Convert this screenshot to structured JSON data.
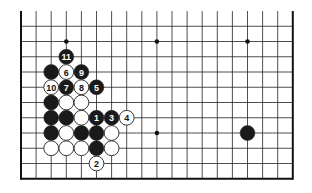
{
  "diagram": {
    "type": "go-board-partial",
    "board_size": 19,
    "visible_rows": 12,
    "grid": {
      "left": 21,
      "top": 11,
      "col_spacing": 15.1,
      "row_spacing": 15.25,
      "cols": 19,
      "rows": 12,
      "open_top": true,
      "line_color": "#222222",
      "border_color": "#111111"
    },
    "star_points": [
      {
        "col": 3,
        "row": 2
      },
      {
        "col": 9,
        "row": 2
      },
      {
        "col": 15,
        "row": 2
      },
      {
        "col": 3,
        "row": 8
      },
      {
        "col": 9,
        "row": 8
      },
      {
        "col": 15,
        "row": 8
      }
    ],
    "stones": [
      {
        "col": 3,
        "row": 3,
        "color": "black",
        "label": "11"
      },
      {
        "col": 2,
        "row": 4,
        "color": "black",
        "label": ""
      },
      {
        "col": 3,
        "row": 4,
        "color": "white",
        "label": "6"
      },
      {
        "col": 4,
        "row": 4,
        "color": "black",
        "label": "9"
      },
      {
        "col": 2,
        "row": 5,
        "color": "white",
        "label": "10"
      },
      {
        "col": 3,
        "row": 5,
        "color": "black",
        "label": "7"
      },
      {
        "col": 4,
        "row": 5,
        "color": "white",
        "label": "8"
      },
      {
        "col": 5,
        "row": 5,
        "color": "black",
        "label": "5"
      },
      {
        "col": 2,
        "row": 6,
        "color": "black",
        "label": ""
      },
      {
        "col": 3,
        "row": 6,
        "color": "white",
        "label": ""
      },
      {
        "col": 4,
        "row": 6,
        "color": "white",
        "label": ""
      },
      {
        "col": 2,
        "row": 7,
        "color": "black",
        "label": ""
      },
      {
        "col": 3,
        "row": 7,
        "color": "black",
        "label": ""
      },
      {
        "col": 4,
        "row": 7,
        "color": "white",
        "label": ""
      },
      {
        "col": 5,
        "row": 7,
        "color": "black",
        "label": "1"
      },
      {
        "col": 6,
        "row": 7,
        "color": "black",
        "label": "3"
      },
      {
        "col": 7,
        "row": 7,
        "color": "white",
        "label": "4"
      },
      {
        "col": 2,
        "row": 8,
        "color": "black",
        "label": ""
      },
      {
        "col": 3,
        "row": 8,
        "color": "white",
        "label": ""
      },
      {
        "col": 4,
        "row": 8,
        "color": "black",
        "label": ""
      },
      {
        "col": 5,
        "row": 8,
        "color": "black",
        "label": ""
      },
      {
        "col": 6,
        "row": 8,
        "color": "white",
        "label": ""
      },
      {
        "col": 2,
        "row": 9,
        "color": "white",
        "label": ""
      },
      {
        "col": 3,
        "row": 9,
        "color": "white",
        "label": ""
      },
      {
        "col": 4,
        "row": 9,
        "color": "white",
        "label": ""
      },
      {
        "col": 5,
        "row": 9,
        "color": "black",
        "label": ""
      },
      {
        "col": 6,
        "row": 9,
        "color": "white",
        "label": ""
      },
      {
        "col": 5,
        "row": 10,
        "color": "white",
        "label": "2"
      },
      {
        "col": 15,
        "row": 8,
        "color": "black",
        "label": ""
      }
    ],
    "colors": {
      "black_stone": "#1a1a1a",
      "white_stone": "#ffffff",
      "stone_outline": "#222222",
      "background": "#ffffff"
    }
  }
}
